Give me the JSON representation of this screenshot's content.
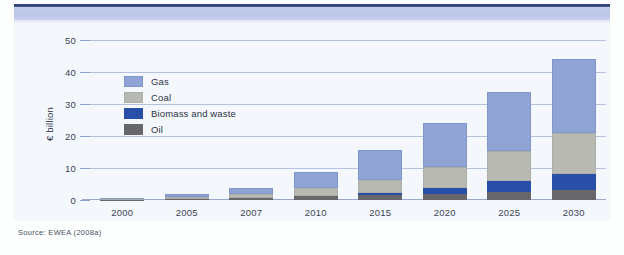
{
  "figure": {
    "source_note": "Source: EWEA (2008a)"
  },
  "chart_data": {
    "type": "bar",
    "stacked": true,
    "title": "",
    "xlabel": "",
    "ylabel": "€ billion",
    "ylim": [
      0,
      50
    ],
    "yticks": [
      0,
      10,
      20,
      30,
      40,
      50
    ],
    "grid": true,
    "legend_position": "inside-top-left",
    "categories": [
      "2000",
      "2005",
      "2007",
      "2010",
      "2015",
      "2020",
      "2025",
      "2030"
    ],
    "series": [
      {
        "name": "Oil",
        "color": "#676769",
        "values": [
          0.1,
          0.3,
          0.5,
          1.1,
          1.5,
          1.9,
          2.6,
          3.0
        ]
      },
      {
        "name": "Biomass and waste",
        "color": "#2a4fa8",
        "values": [
          0.05,
          0.1,
          0.2,
          0.3,
          0.8,
          1.8,
          3.3,
          5.1
        ]
      },
      {
        "name": "Coal",
        "color": "#b9b9b4",
        "values": [
          0.1,
          0.5,
          1.3,
          2.5,
          4.1,
          6.7,
          9.4,
          12.9
        ]
      },
      {
        "name": "Gas",
        "color": "#8fa3d4",
        "values": [
          0.25,
          0.9,
          1.8,
          4.9,
          9.1,
          13.8,
          18.6,
          23.0
        ]
      }
    ],
    "totals": [
      0.5,
      1.8,
      3.8,
      8.8,
      15.5,
      24.2,
      33.9,
      44.0
    ]
  },
  "legend": {
    "items": [
      {
        "label": "Gas"
      },
      {
        "label": "Coal"
      },
      {
        "label": "Biomass and waste"
      },
      {
        "label": "Oil"
      }
    ]
  },
  "colors": {
    "gas": "#8fa3d4",
    "coal": "#b9b9b4",
    "biomass": "#2a4fa8",
    "oil": "#676769",
    "panel_bg": "#f4f8fc",
    "band": "#c3ccea",
    "rule": "#2c3f72",
    "gridline": "#8d9fc8"
  }
}
